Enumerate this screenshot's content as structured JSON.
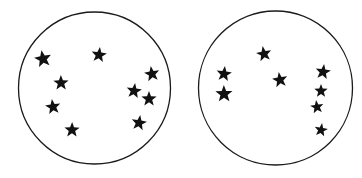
{
  "colors": {
    "stroke": "#1a1a1a",
    "fill": "#111111",
    "background": "#ffffff"
  },
  "panels": [
    {
      "name": "left-circle",
      "circle": {
        "cx": 94.5,
        "cy": 88,
        "r": 76
      },
      "stars": [
        {
          "x": 43,
          "y": 59,
          "s": 9
        },
        {
          "x": 99,
          "y": 55,
          "s": 8
        },
        {
          "x": 61,
          "y": 83,
          "s": 8
        },
        {
          "x": 152,
          "y": 74,
          "s": 8
        },
        {
          "x": 134,
          "y": 91,
          "s": 8
        },
        {
          "x": 149,
          "y": 99,
          "s": 8
        },
        {
          "x": 53,
          "y": 107,
          "s": 8
        },
        {
          "x": 139,
          "y": 123,
          "s": 8
        },
        {
          "x": 72,
          "y": 130,
          "s": 8
        }
      ]
    },
    {
      "name": "right-circle",
      "circle": {
        "cx": 275.5,
        "cy": 88,
        "r": 77
      },
      "stars": [
        {
          "x": 264,
          "y": 54,
          "s": 8
        },
        {
          "x": 224,
          "y": 74,
          "s": 8
        },
        {
          "x": 224,
          "y": 94,
          "s": 9
        },
        {
          "x": 280,
          "y": 80,
          "s": 8
        },
        {
          "x": 323,
          "y": 72,
          "s": 8
        },
        {
          "x": 321,
          "y": 91,
          "s": 7
        },
        {
          "x": 317,
          "y": 107,
          "s": 7
        },
        {
          "x": 321,
          "y": 130,
          "s": 7
        }
      ]
    }
  ]
}
